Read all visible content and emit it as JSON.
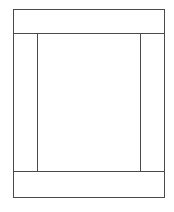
{
  "diagram": {
    "type": "page-layout-wireframe",
    "stroke_color": "#4a4a4a",
    "background": "#ffffff",
    "regions": [
      {
        "id": "header",
        "label": ""
      },
      {
        "id": "left-sidebar",
        "label": ""
      },
      {
        "id": "main-content",
        "label": ""
      },
      {
        "id": "right-sidebar",
        "label": ""
      },
      {
        "id": "footer",
        "label": ""
      }
    ]
  }
}
